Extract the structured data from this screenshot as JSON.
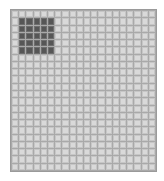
{
  "grid": {
    "columns": 20,
    "rows": 22,
    "selection": {
      "start_col": 2,
      "start_row": 2,
      "end_col": 6,
      "end_row": 6
    },
    "colors": {
      "cell": "#d9d9d9",
      "cell_border": "#c6c6c6",
      "grid_line": "#a9a9a9",
      "selected": "#565656"
    }
  }
}
